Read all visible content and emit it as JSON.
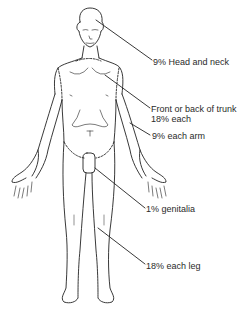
{
  "diagram": {
    "title": "",
    "labels": [
      {
        "id": "head",
        "text": "9% Head and neck",
        "x": 153,
        "y": 58
      },
      {
        "id": "trunk1",
        "text": "Front or back of trunk",
        "x": 151,
        "y": 104
      },
      {
        "id": "trunk2",
        "text": "18% each",
        "x": 151,
        "y": 114
      },
      {
        "id": "arm",
        "text": "9% each arm",
        "x": 152,
        "y": 132
      },
      {
        "id": "genitalia",
        "text": "1% genitalia",
        "x": 146,
        "y": 205
      },
      {
        "id": "leg",
        "text": "18% each leg",
        "x": 146,
        "y": 262
      }
    ],
    "colors": {
      "line": "#222222",
      "text": "#2a2a2a",
      "background": "#ffffff"
    }
  }
}
